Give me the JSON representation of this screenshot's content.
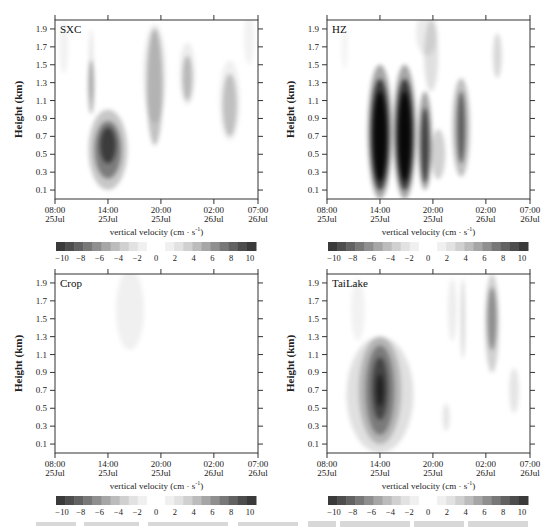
{
  "chart_data": [
    {
      "type": "heatmap",
      "title": "SXC",
      "xlabel": "vertical velocity (cm · s⁻¹)",
      "ylabel": "Height (km)",
      "x_ticks": [
        "08:00\n25Jul",
        "14:00\n25Jul",
        "20:00\n25Jul",
        "02:00\n26Jul",
        "07:00\n26Jul"
      ],
      "y_ticks": [
        0.1,
        0.3,
        0.5,
        0.7,
        0.9,
        1.1,
        1.3,
        1.5,
        1.7,
        1.9
      ],
      "ylim": [
        0.0,
        2.0
      ],
      "colorbar": {
        "ticks": [
          -10,
          -8,
          -6,
          -4,
          -2,
          0,
          2,
          4,
          6,
          8,
          10
        ],
        "colormap": "gray (dark at ±10, white near 0)"
      },
      "features": [
        {
          "center_time": "14:00 25Jul",
          "center_height_km": 0.55,
          "peak_value": -5,
          "note": "moderate downdraft core 0.2-1.0 km"
        },
        {
          "center_time": "12:30 25Jul",
          "center_height_km": 1.25,
          "peak_value": -2,
          "note": "thin weak column"
        },
        {
          "center_time": "19:00 25Jul",
          "center_height_km": 1.2,
          "peak_value": -2,
          "note": "weak column 0.6-1.9 km"
        },
        {
          "center_time": "23:00 25Jul",
          "center_height_km": 1.35,
          "peak_value": -2
        },
        {
          "center_time": "04:00 26Jul",
          "center_height_km": 1.05,
          "peak_value": -2
        }
      ]
    },
    {
      "type": "heatmap",
      "title": "HZ",
      "xlabel": "vertical velocity (cm · s⁻¹)",
      "ylabel": "Height (km)",
      "x_ticks": [
        "08:00\n25Jul",
        "14:00\n25Jul",
        "20:00\n25Jul",
        "02:00\n26Jul",
        "07:00\n26Jul"
      ],
      "y_ticks": [
        0.1,
        0.3,
        0.5,
        0.7,
        0.9,
        1.1,
        1.3,
        1.5,
        1.7,
        1.9
      ],
      "ylim": [
        0.0,
        2.0
      ],
      "colorbar": {
        "ticks": [
          -10,
          -8,
          -6,
          -4,
          -2,
          0,
          2,
          4,
          6,
          8,
          10
        ],
        "colormap": "gray"
      },
      "features": [
        {
          "center_time": "14:00 25Jul",
          "center_height_km": 0.75,
          "peak_value": -10,
          "note": "strong column 0.1-1.5 km"
        },
        {
          "center_time": "16:30 25Jul",
          "center_height_km": 0.75,
          "peak_value": -10,
          "note": "strong column 0.1-1.5 km"
        },
        {
          "center_time": "19:00 25Jul",
          "center_height_km": 0.65,
          "peak_value": -6
        },
        {
          "center_time": "21:00 25Jul",
          "center_height_km": 0.5,
          "peak_value": -2
        },
        {
          "center_time": "23:30 25Jul",
          "center_height_km": 0.8,
          "peak_value": -5
        },
        {
          "center_time": "03:00 26Jul",
          "center_height_km": 1.6,
          "peak_value": -2
        }
      ]
    },
    {
      "type": "heatmap",
      "title": "Crop",
      "xlabel": "vertical velocity (cm · s⁻¹)",
      "ylabel": "Height (km)",
      "x_ticks": [
        "08:00\n25Jul",
        "14:00\n25Jul",
        "20:00\n25Jul",
        "02:00\n26Jul",
        "07:00\n26Jul"
      ],
      "y_ticks": [
        0.1,
        0.3,
        0.5,
        0.7,
        0.9,
        1.1,
        1.3,
        1.5,
        1.7,
        1.9
      ],
      "ylim": [
        0.0,
        2.0
      ],
      "colorbar": {
        "ticks": [
          -10,
          -8,
          -6,
          -4,
          -2,
          0,
          2,
          4,
          6,
          8,
          10
        ],
        "colormap": "gray"
      },
      "features": [
        {
          "center_time": "17:00 25Jul",
          "center_height_km": 1.6,
          "peak_value": -1,
          "note": "very faint area 1.2-2.0 km"
        }
      ]
    },
    {
      "type": "heatmap",
      "title": "TaiLake",
      "xlabel": "vertical velocity (cm · s⁻¹)",
      "ylabel": "Height (km)",
      "x_ticks": [
        "08:00\n25Jul",
        "14:00\n25Jul",
        "20:00\n25Jul",
        "02:00\n26Jul",
        "07:00\n26Jul"
      ],
      "y_ticks": [
        0.1,
        0.3,
        0.5,
        0.7,
        0.9,
        1.1,
        1.3,
        1.5,
        1.7,
        1.9
      ],
      "ylim": [
        0.0,
        2.0
      ],
      "colorbar": {
        "ticks": [
          -10,
          -8,
          -6,
          -4,
          -2,
          0,
          2,
          4,
          6,
          8,
          10
        ],
        "colormap": "gray"
      },
      "features": [
        {
          "center_time": "14:00 25Jul",
          "center_height_km": 0.7,
          "peak_value": -6,
          "note": "broad downdraft 0.1-1.5 km"
        },
        {
          "center_time": "02:30 26Jul",
          "center_height_km": 1.45,
          "peak_value": -3
        },
        {
          "center_time": "23:30 25Jul",
          "center_height_km": 1.4,
          "peak_value": -2
        },
        {
          "center_time": "05:00 26Jul",
          "center_height_km": 0.7,
          "peak_value": -1
        }
      ]
    }
  ],
  "panels": [
    {
      "title": "SXC"
    },
    {
      "title": "HZ"
    },
    {
      "title": "Crop"
    },
    {
      "title": "TaiLake"
    }
  ],
  "axis": {
    "ylabel": "Height (km)",
    "xlabel": "vertical velocity (cm · s",
    "xlabel_sup": "-1",
    "xlabel_end": ")",
    "y_ticks": [
      "1.9",
      "1.7",
      "1.5",
      "1.3",
      "1.1",
      "0.9",
      "0.7",
      "0.5",
      "0.3",
      "0.1"
    ],
    "x_ticks_time": [
      "08:00",
      "14:00",
      "20:00",
      "02:00",
      "07:00"
    ],
    "x_ticks_date": [
      "25Jul",
      "25Jul",
      "25Jul",
      "26Jul",
      "26Jul"
    ]
  },
  "colorbar": {
    "labels": [
      "−10",
      "−8",
      "−6",
      "−4",
      "−2",
      "0",
      "2",
      "4",
      "6",
      "8",
      "10"
    ],
    "colors": [
      "#3a3a3a",
      "#4d4d4d",
      "#626262",
      "#787878",
      "#8f8f8f",
      "#a6a6a6",
      "#bcbcbc",
      "#d0d0d0",
      "#e2e2e2",
      "#f0f0f0",
      "#ffffff",
      "#ffffff",
      "#f0f0f0",
      "#e2e2e2",
      "#d0d0d0",
      "#bcbcbc",
      "#a6a6a6",
      "#8f8f8f",
      "#787878",
      "#626262",
      "#4d4d4d",
      "#3a3a3a"
    ]
  }
}
